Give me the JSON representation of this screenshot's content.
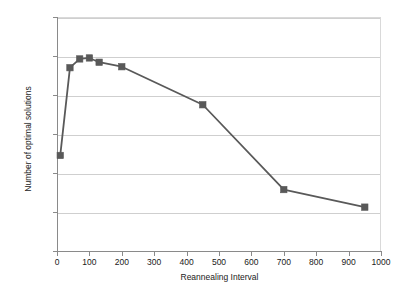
{
  "chart_data": {
    "type": "line",
    "title": "",
    "xlabel": "Reannealing Interval",
    "ylabel": "Number of optimal solutions",
    "xlim": [
      0,
      1000
    ],
    "ylim": [
      0,
      1200
    ],
    "xticks": [
      0,
      100,
      200,
      300,
      400,
      500,
      600,
      700,
      800,
      900,
      1000
    ],
    "yticks": [
      0,
      200,
      400,
      600,
      800,
      1000,
      1200
    ],
    "grid": "horizontal",
    "legend": "none",
    "marker": "square",
    "series_color": "#595959",
    "grid_color": "#cfcfcf",
    "axis_color": "#8a8a8a",
    "series": [
      {
        "name": "Number of optimal solutions",
        "x": [
          10,
          40,
          70,
          100,
          130,
          200,
          450,
          700,
          950
        ],
        "values": [
          490,
          940,
          985,
          990,
          968,
          945,
          750,
          315,
          225
        ]
      }
    ]
  },
  "axis": {
    "x_title": "Reannealing Interval",
    "y_title": "Number of optimal solutions",
    "x_tick_labels": [
      "0",
      "100",
      "200",
      "300",
      "400",
      "500",
      "600",
      "700",
      "800",
      "900",
      "1000"
    ],
    "y_tick_labels": [
      "0",
      "200",
      "400",
      "600",
      "800",
      "1000",
      "1200"
    ]
  }
}
